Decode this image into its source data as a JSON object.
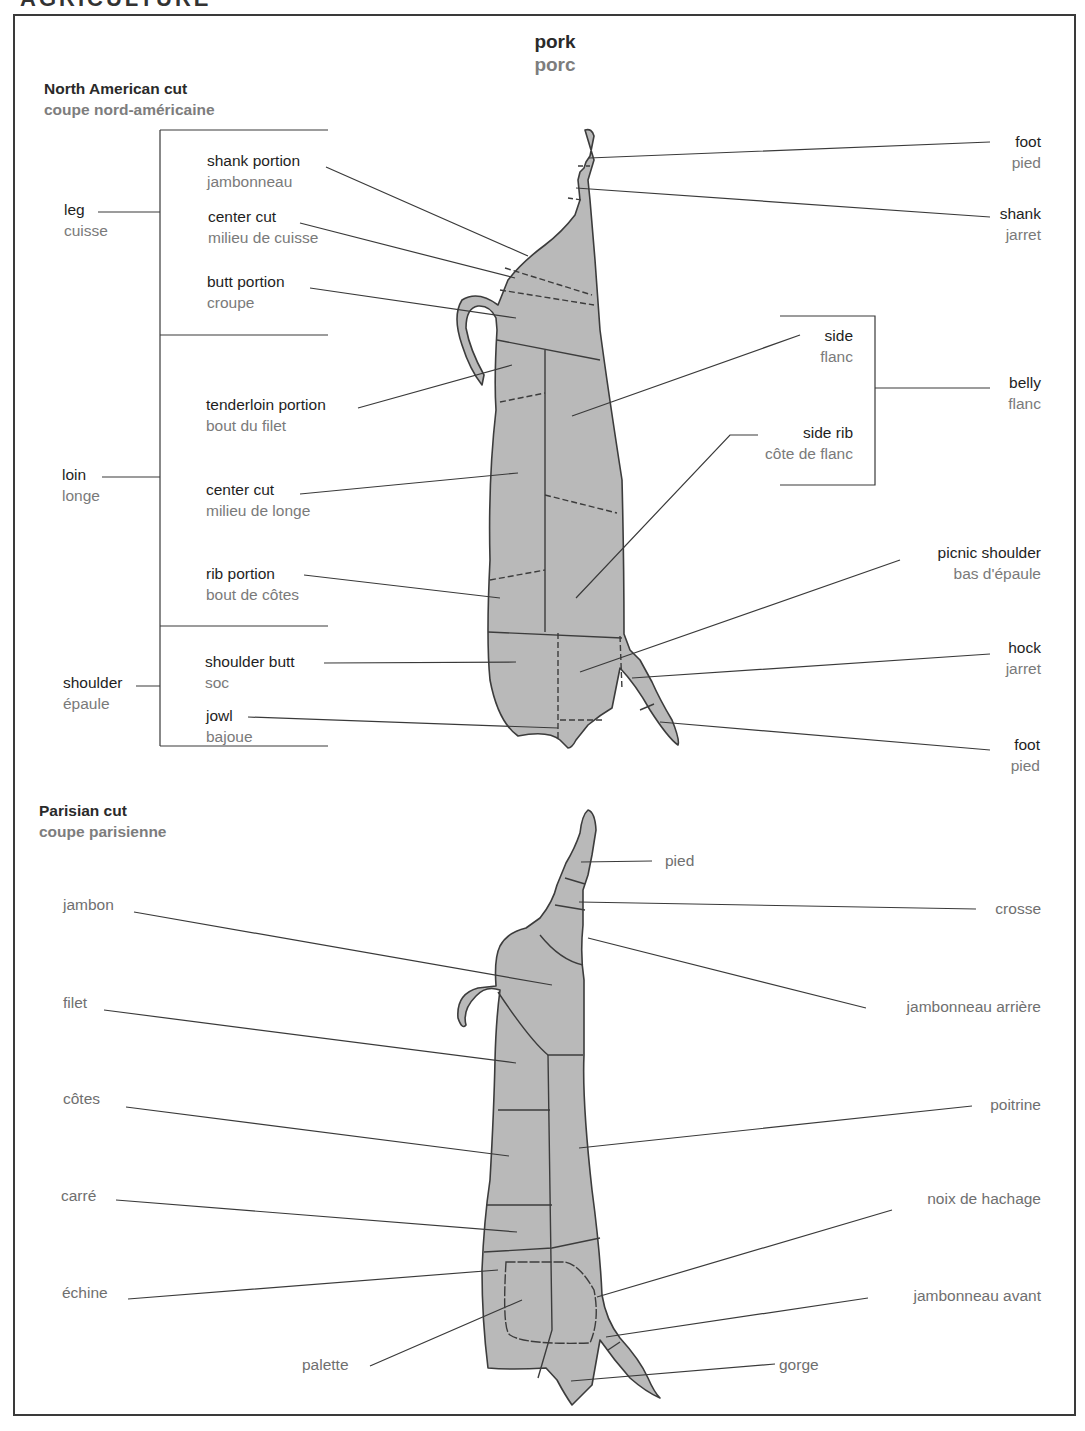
{
  "page": {
    "title_en": "pork",
    "title_fr": "porc",
    "header_clipped": "AGRICULTURE"
  },
  "north_american": {
    "heading_en": "North American cut",
    "heading_fr": "coupe nord-américaine",
    "groups": [
      {
        "en": "leg",
        "fr": "cuisse"
      },
      {
        "en": "loin",
        "fr": "longe"
      },
      {
        "en": "shoulder",
        "fr": "épaule"
      },
      {
        "en": "belly",
        "fr": "flanc"
      }
    ],
    "left_cuts": [
      {
        "en": "shank portion",
        "fr": "jambonneau"
      },
      {
        "en": "center cut",
        "fr": "milieu de cuisse"
      },
      {
        "en": "butt portion",
        "fr": "croupe"
      },
      {
        "en": "tenderloin portion",
        "fr": "bout du filet"
      },
      {
        "en": "center cut",
        "fr": "milieu de longe"
      },
      {
        "en": "rib portion",
        "fr": "bout de côtes"
      },
      {
        "en": "shoulder butt",
        "fr": "soc"
      },
      {
        "en": "jowl",
        "fr": "bajoue"
      }
    ],
    "right_cuts": [
      {
        "en": "foot",
        "fr": "pied"
      },
      {
        "en": "shank",
        "fr": "jarret"
      },
      {
        "en": "side",
        "fr": "flanc"
      },
      {
        "en": "side rib",
        "fr": "côte de flanc"
      },
      {
        "en": "picnic shoulder",
        "fr": "bas d'épaule"
      },
      {
        "en": "hock",
        "fr": "jarret"
      },
      {
        "en": "foot",
        "fr": "pied"
      }
    ]
  },
  "parisian": {
    "heading_en": "Parisian cut",
    "heading_fr": "coupe parisienne",
    "left_cuts": [
      "jambon",
      "filet",
      "côtes",
      "carré",
      "échine",
      "palette"
    ],
    "right_cuts": [
      "pied",
      "crosse",
      "jambonneau arrière",
      "poitrine",
      "noix de hachage",
      "jambonneau avant",
      "gorge"
    ]
  },
  "colors": {
    "meat_fill": "#b9b9b9",
    "outline": "#3c3c3c",
    "english_text": "#1e1e1e",
    "french_text": "#7a7a7a"
  }
}
